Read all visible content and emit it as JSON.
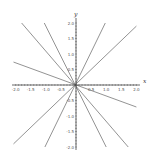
{
  "chart_data": {
    "type": "line",
    "title": "",
    "xlabel": "x",
    "ylabel": "y",
    "xlim": [
      -2.0,
      2.0
    ],
    "ylim": [
      -2.0,
      2.0
    ],
    "grid": false,
    "legend": null,
    "x_ticks": [
      "-2.0",
      "-1.5",
      "-1.0",
      "-0.5",
      "0.5",
      "1.0",
      "1.5",
      "2.0"
    ],
    "y_ticks": [
      "2.0",
      "1.5",
      "1.0",
      "0.5",
      "-0.5",
      "-1.0",
      "-1.5",
      "-2.0"
    ],
    "line_color": "#777777",
    "series": [
      {
        "name": "line1",
        "slope": -1.15,
        "points": [
          [
            -1.8,
            2.0
          ],
          [
            1.73,
            -2.0
          ]
        ]
      },
      {
        "name": "line2",
        "slope": -1.9,
        "points": [
          [
            -1.05,
            2.0
          ],
          [
            1.0,
            -2.0
          ]
        ]
      },
      {
        "name": "line3",
        "slope": -0.36,
        "points": [
          [
            -2.07,
            0.74
          ],
          [
            2.0,
            -0.71
          ]
        ]
      },
      {
        "name": "line4",
        "slope": 2.0,
        "points": [
          [
            -1.03,
            -2.0
          ],
          [
            0.97,
            2.0
          ]
        ]
      },
      {
        "name": "line5",
        "slope": 0.93,
        "points": [
          [
            -2.07,
            -1.9
          ],
          [
            2.0,
            1.9
          ]
        ]
      }
    ]
  }
}
